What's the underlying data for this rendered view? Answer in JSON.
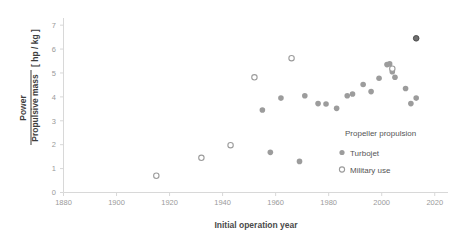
{
  "chart_data": {
    "type": "scatter",
    "title": "",
    "xlabel": "Initial operation year",
    "ylabel": "Power / Propulsive mass",
    "ylabel_numerator": "Power",
    "ylabel_denominator": "Propulsive mass",
    "yunit": "[ hp / kg ]",
    "xlim": [
      1880,
      2025
    ],
    "ylim": [
      0,
      7.3
    ],
    "xticks": [
      1880,
      1900,
      1920,
      1940,
      1960,
      1980,
      2000,
      2020
    ],
    "xticklabels": [
      "1880",
      "1900",
      "1920",
      "1940",
      "1960",
      "1980",
      "2000",
      "2020"
    ],
    "yticks": [
      0,
      1,
      2,
      3,
      4,
      5,
      6,
      7
    ],
    "yticklabels": [
      "0",
      "1",
      "2",
      "3",
      "4",
      "5",
      "6",
      "7"
    ],
    "grid": false,
    "legend_position": "lower-right",
    "legend_title": "Propeller propulsion",
    "series": [
      {
        "name": "Turbojet",
        "marker": "filled-circle",
        "color": "#9c9c9c",
        "points": [
          {
            "x": 1955,
            "y": 3.45
          },
          {
            "x": 1958,
            "y": 1.68
          },
          {
            "x": 1962,
            "y": 3.95
          },
          {
            "x": 1969,
            "y": 1.3
          },
          {
            "x": 1971,
            "y": 4.05
          },
          {
            "x": 1976,
            "y": 3.72
          },
          {
            "x": 1979,
            "y": 3.7
          },
          {
            "x": 1983,
            "y": 3.52
          },
          {
            "x": 1987,
            "y": 4.05
          },
          {
            "x": 1989,
            "y": 4.12
          },
          {
            "x": 1993,
            "y": 4.52
          },
          {
            "x": 1996,
            "y": 4.22
          },
          {
            "x": 1999,
            "y": 4.78
          },
          {
            "x": 2002,
            "y": 5.35
          },
          {
            "x": 2003,
            "y": 5.38
          },
          {
            "x": 2004,
            "y": 5.05
          },
          {
            "x": 2005,
            "y": 4.82
          },
          {
            "x": 2009,
            "y": 4.35
          },
          {
            "x": 2011,
            "y": 3.72
          },
          {
            "x": 2013,
            "y": 3.95
          },
          {
            "x": 2013,
            "y": 6.45
          }
        ]
      },
      {
        "name": "Military use",
        "marker": "open-circle",
        "color": "#9c9c9c",
        "points": [
          {
            "x": 1915,
            "y": 0.7
          },
          {
            "x": 1932,
            "y": 1.45
          },
          {
            "x": 1943,
            "y": 1.98
          },
          {
            "x": 1952,
            "y": 4.82
          },
          {
            "x": 1966,
            "y": 5.62
          },
          {
            "x": 2004,
            "y": 5.18
          }
        ]
      }
    ]
  },
  "legend": {
    "title": "Propeller propulsion",
    "items": [
      {
        "label": "Turbojet",
        "marker": "filled-circle"
      },
      {
        "label": "Military use",
        "marker": "open-circle"
      }
    ]
  },
  "axes": {
    "x_title": "Initial operation year",
    "y_numerator": "Power",
    "y_denominator": "Propulsive mass",
    "y_unit": "[ hp / kg ]"
  }
}
